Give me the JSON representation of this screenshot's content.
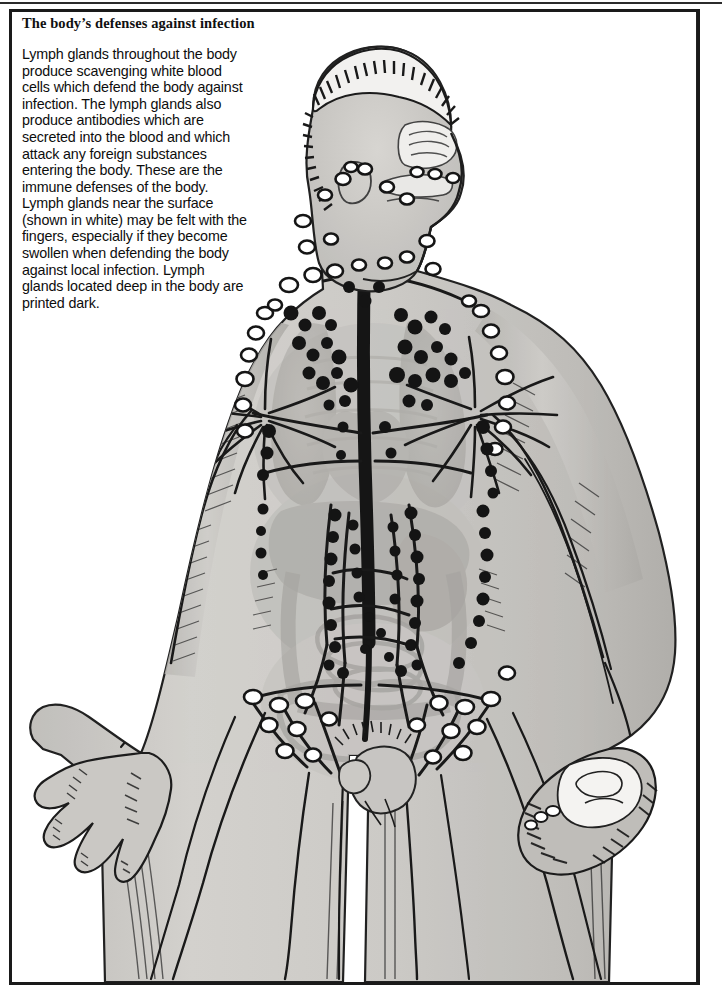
{
  "page": {
    "frame_color": "#1a1a1a",
    "background_color": "#ffffff"
  },
  "caption": {
    "title": "The body’s defenses against infection",
    "paragraph_lines": [
      "Lymph glands throughout the body",
      "produce scavenging white blood",
      "cells which defend the body against",
      "infection. The lymph glands also",
      "produce antibodies which are",
      "secreted into the blood and which",
      "attack any foreign substances",
      "entering the body. These are the",
      "immune defenses of the body.",
      "Lymph glands near the surface",
      "(shown in white) may be felt with the",
      "fingers, especially if they become",
      "swollen when defending the body",
      "against local infection. Lymph",
      "glands located deep in the body are",
      "printed dark."
    ],
    "full_text": "Lymph glands throughout the body produce scavenging white blood cells which defend the body against infection. The lymph glands also produce antibodies which are secreted into the blood and which attack any foreign substances entering the body. These are the immune defenses of the body. Lymph glands near the surface (shown in white) may be felt with the fingers, especially if they become swollen when defending the body against local infection. Lymph glands located deep in the body are printed dark."
  },
  "figure": {
    "name": "human-lymphatic-system-illustration",
    "style": "black-and-white engraving / halftone wash",
    "palette": {
      "skin_wash": "#c8c6c2",
      "skin_wash_light": "#d8d6d2",
      "organ_wash": "#b0aeaa",
      "organ_wash_dark": "#9b9995",
      "ink": "#111111",
      "superficial_node_fill": "#ffffff",
      "deep_node_fill": "#101010",
      "paper": "#ffffff"
    },
    "parts": [
      "head-profile",
      "hair",
      "nasal-cavity",
      "oral-cavity",
      "neck",
      "shoulders",
      "left-arm",
      "right-arm",
      "open-left-hand",
      "clenched-right-hand",
      "thorax",
      "lungs",
      "heart",
      "liver",
      "stomach",
      "small-intestine",
      "large-intestine",
      "pelvis",
      "genitals",
      "thighs"
    ],
    "annotations": {
      "superficial_nodes_label": "shown in white",
      "deep_nodes_label": "printed dark"
    }
  }
}
